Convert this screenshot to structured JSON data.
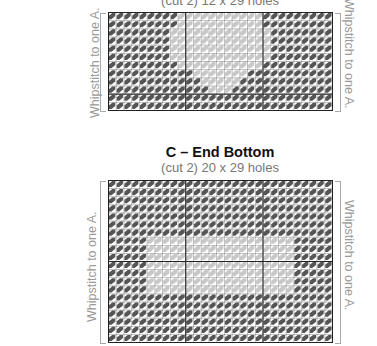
{
  "pieces": [
    {
      "id": "B",
      "title": "",
      "subtitle": "(cut 2) 12 x 29 holes",
      "left_note": "Whipstitch to one A.",
      "right_note": "Whipstitch to one A.",
      "grid": {
        "cols": 29,
        "rows": 12
      },
      "motif": "heart"
    },
    {
      "id": "C",
      "title": "C – End Bottom",
      "subtitle": "(cut 2) 20 x 29 holes",
      "left_note": "Whipstitch to one A.",
      "right_note": "Whipstitch to one A.",
      "grid": {
        "cols": 29,
        "rows": 20
      },
      "motif": "rectangle"
    }
  ],
  "colors": {
    "dark_stitch": "#555555",
    "light_stitch": "#c8c8c8",
    "grid_line": "#222222",
    "note_text": "#9a9a9a"
  }
}
